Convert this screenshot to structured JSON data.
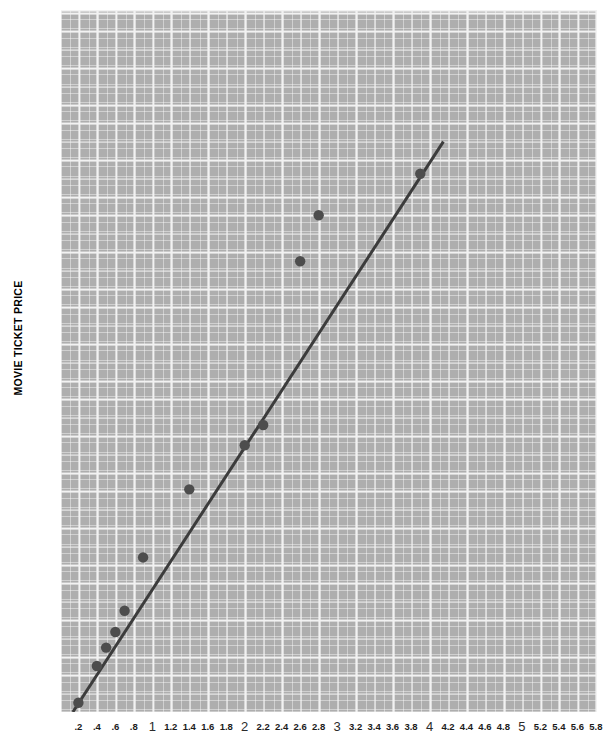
{
  "chart_data": {
    "type": "scatter",
    "title": "",
    "xlabel": "",
    "ylabel": "MOVIE TICKET PRICE",
    "xlim": [
      0,
      6.1
    ],
    "ylim": [
      0,
      6.1
    ],
    "grid": true,
    "legend": "none",
    "colors": {
      "plot_background": "#aeaeae",
      "grid_major": "#f2f2f2",
      "grid_minor": "#ffffff",
      "point": "#4d4d4d",
      "trend_line": "#3c3c3c",
      "text": "#1b1b1b"
    },
    "xticks": [
      ".2",
      ".4",
      ".6",
      ".8",
      "1",
      "1.2",
      "1.4",
      "1.6",
      "1.8",
      "2",
      "2.2",
      "2.4",
      "2.6",
      "2.8",
      "3",
      "3.2",
      "3.4",
      "3.6",
      "3.8",
      "4",
      "4.2",
      "4.4",
      "4.6",
      "4.8",
      "5",
      "5.2",
      "5.4",
      "5.6",
      "5.8",
      "6"
    ],
    "xtick_values": [
      0.2,
      0.4,
      0.6,
      0.8,
      1.0,
      1.2,
      1.4,
      1.6,
      1.8,
      2.0,
      2.2,
      2.4,
      2.6,
      2.8,
      3.0,
      3.2,
      3.4,
      3.6,
      3.8,
      4.0,
      4.2,
      4.4,
      4.6,
      4.8,
      5.0,
      5.2,
      5.4,
      5.6,
      5.8,
      6.0
    ],
    "yticks": [
      ".20",
      ".40",
      ".60",
      ".80",
      "1",
      "1.20",
      "1.40",
      "1.60",
      "1.80",
      "2",
      "2.20",
      "2.40",
      "2.60",
      "2.80",
      "3",
      "3.20",
      "3.40",
      "3.60",
      "3.80",
      "4",
      "4.20",
      "4.40",
      "4.60",
      "4.80",
      "5",
      "5.20",
      "5.40",
      "5.60",
      "5.80",
      "6"
    ],
    "ytick_values": [
      0.2,
      0.4,
      0.6,
      0.8,
      1.0,
      1.2,
      1.4,
      1.6,
      1.8,
      2.0,
      2.2,
      2.4,
      2.6,
      2.8,
      3.0,
      3.2,
      3.4,
      3.6,
      3.8,
      4.0,
      4.2,
      4.4,
      4.6,
      4.8,
      5.0,
      5.2,
      5.4,
      5.6,
      5.8,
      6.0
    ],
    "points": [
      {
        "x": 0.2,
        "y": 0.2
      },
      {
        "x": 0.4,
        "y": 0.6
      },
      {
        "x": 0.5,
        "y": 0.8
      },
      {
        "x": 0.6,
        "y": 0.97
      },
      {
        "x": 0.7,
        "y": 1.2
      },
      {
        "x": 0.9,
        "y": 1.78
      },
      {
        "x": 1.4,
        "y": 2.52
      },
      {
        "x": 2.0,
        "y": 3.0
      },
      {
        "x": 2.2,
        "y": 3.22
      },
      {
        "x": 2.6,
        "y": 5.0
      },
      {
        "x": 2.8,
        "y": 5.5
      },
      {
        "x": 3.9,
        "y": 5.95
      }
    ],
    "trend_line": {
      "x1": 0.14,
      "y1": 0.1,
      "x2": 4.15,
      "y2": 6.3
    }
  }
}
